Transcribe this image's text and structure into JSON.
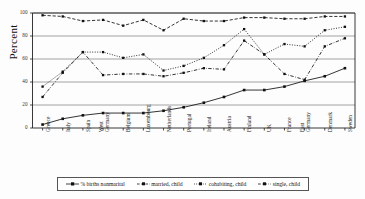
{
  "chart_data": {
    "type": "line",
    "title": "",
    "xlabel": "",
    "ylabel": "Percent",
    "ylim": [
      0,
      100
    ],
    "yticks": [
      0,
      20,
      40,
      60,
      80,
      100
    ],
    "grid": true,
    "legend_position": "bottom",
    "categories": [
      "Greece",
      "Italy",
      "Spain",
      "West Germany",
      "Belgium",
      "Luxembourg",
      "Netherlands",
      "Portugal",
      "Ireland",
      "Austria",
      "Finland",
      "UK",
      "France",
      "East Germany",
      "Denmark",
      "Sweden"
    ],
    "series": [
      {
        "name": "% births nonmarital",
        "values": [
          3,
          8,
          11,
          13,
          13,
          13,
          15,
          18,
          22,
          27,
          33,
          33,
          36,
          41,
          45,
          52
        ]
      },
      {
        "name": "married, child",
        "values": [
          98,
          97,
          93,
          94,
          89,
          94,
          85,
          95,
          93,
          93,
          96,
          96,
          95,
          95,
          97,
          97
        ]
      },
      {
        "name": "cohabiting, child",
        "values": [
          36,
          49,
          66,
          66,
          61,
          64,
          50,
          54,
          61,
          72,
          86,
          64,
          73,
          71,
          85,
          88
        ]
      },
      {
        "name": "single, child",
        "values": [
          27,
          48,
          66,
          46,
          47,
          47,
          45,
          48,
          52,
          51,
          76,
          64,
          47,
          42,
          71,
          78
        ]
      }
    ]
  },
  "axis": {
    "ylabel": "Percent",
    "ytick_labels": [
      "0",
      "20",
      "40",
      "60",
      "80",
      "100"
    ]
  },
  "legend": {
    "items": [
      {
        "label": "% births nonmarital",
        "marker": "square-solid-line"
      },
      {
        "label": "married, child",
        "marker": "square-dashed-line"
      },
      {
        "label": "cohabiting, child",
        "marker": "square-dotted-line"
      },
      {
        "label": "single, child",
        "marker": "square-dashdot-line"
      }
    ]
  }
}
